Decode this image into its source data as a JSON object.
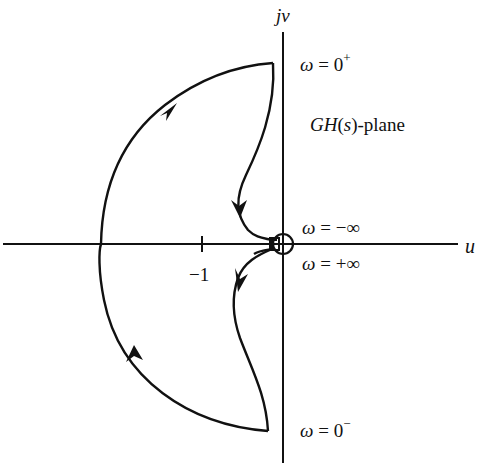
{
  "diagram": {
    "title": "GH(s)-plane",
    "plane_label": "GH(s)-plane",
    "axes": {
      "real_label": "u",
      "imag_label": "jv",
      "ticks": [
        {
          "value": -1,
          "label": "−1"
        }
      ]
    },
    "annotations": {
      "omega_zero_plus": "ω = 0⁺",
      "omega_minus_inf": "ω = −∞",
      "omega_plus_inf": "ω = +∞",
      "omega_zero_minus": "ω = 0⁻"
    },
    "curve": {
      "description": "Nyquist contour: from ω=0⁺ near top of imaginary axis, curves down to origin, small indentation around origin, back down to ω=0⁻, then large left semicircle back to ω=0⁺",
      "arrows": 4,
      "stroke_color": "#111111"
    }
  }
}
